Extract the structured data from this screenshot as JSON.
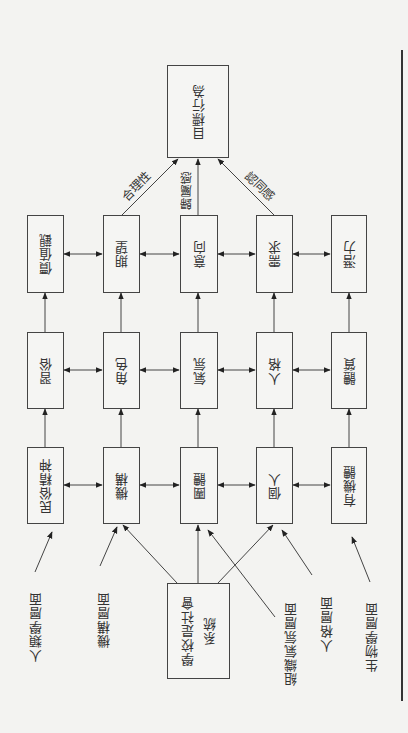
{
  "diagram": {
    "target": {
      "label": "目標行為"
    },
    "source": {
      "line1": "學校是社會",
      "line2": "系統"
    },
    "rows": {
      "top": [
        "價值觀",
        "期望",
        "意向",
        "需求",
        "潛力"
      ],
      "middle": [
        "習俗",
        "角色",
        "氣氛",
        "人格",
        "體質"
      ],
      "bottom": [
        "民俗精神",
        "機構",
        "團體",
        "個人",
        "有機體"
      ]
    },
    "edge_labels": {
      "left": "合理性",
      "center": "歸屬感",
      "right": "認同感"
    },
    "layers": [
      "人類學層面",
      "機構層面",
      "組織氣氛層面",
      "人格層面",
      "生物學層面"
    ]
  },
  "colors": {
    "line": "#444444",
    "background": "#f3f3f1",
    "text": "#333333"
  }
}
